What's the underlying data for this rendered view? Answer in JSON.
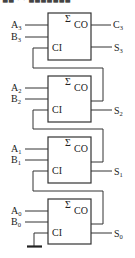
{
  "header": {
    "cropped_text": "■■ · ·  ■■■■■■■"
  },
  "diagram": {
    "sigma_symbol": "Σ",
    "carry_out_label": "CO",
    "carry_in_label": "CI",
    "ground_symbol": "ground",
    "adders": [
      {
        "bit": "3",
        "a": "A",
        "a_sub": "3",
        "b": "B",
        "b_sub": "3",
        "sum": "S",
        "sum_sub": "3",
        "carry_out": "C",
        "carry_out_sub": "3"
      },
      {
        "bit": "2",
        "a": "A",
        "a_sub": "2",
        "b": "B",
        "b_sub": "2",
        "sum": "S",
        "sum_sub": "2"
      },
      {
        "bit": "1",
        "a": "A",
        "a_sub": "1",
        "b": "B",
        "b_sub": "1",
        "sum": "S",
        "sum_sub": "1"
      },
      {
        "bit": "0",
        "a": "A",
        "a_sub": "0",
        "b": "B",
        "b_sub": "0",
        "sum": "S",
        "sum_sub": "0"
      }
    ]
  }
}
